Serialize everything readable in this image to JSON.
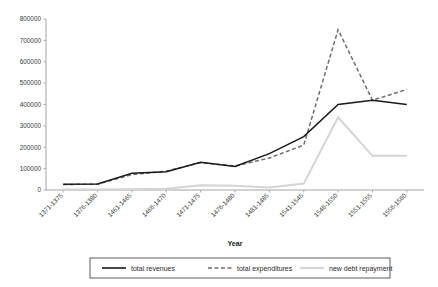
{
  "chart_data": {
    "type": "line",
    "title": "",
    "xlabel": "Year",
    "ylabel": "",
    "ylim": [
      0,
      800000
    ],
    "ytick_values": [
      0,
      100000,
      200000,
      300000,
      400000,
      500000,
      600000,
      700000,
      800000
    ],
    "ytick_labels": [
      "0",
      "100000",
      "200000",
      "300000",
      "400000",
      "500000",
      "600000",
      "700000",
      "800000"
    ],
    "grid": false,
    "legend_position": "bottom",
    "categories": [
      "1371-1375",
      "1376-1380",
      "1461-1465",
      "1466-1470",
      "1471-1475",
      "1476-1480",
      "1481-1485",
      "1541-1545",
      "1546-1550",
      "1551-1555",
      "1556-1560"
    ],
    "series": [
      {
        "name": "total revenues",
        "style": "solid",
        "color": "#1a1a1a",
        "values": [
          27000,
          28000,
          78000,
          85000,
          130000,
          110000,
          170000,
          250000,
          400000,
          420000,
          400000
        ]
      },
      {
        "name": "total expenditures",
        "style": "dashed",
        "color": "#6e6e6e",
        "values": [
          26000,
          27000,
          72000,
          88000,
          128000,
          112000,
          150000,
          210000,
          750000,
          420000,
          470000
        ]
      },
      {
        "name": "new debt repayment",
        "style": "solid",
        "color": "#d4d4d4",
        "values": [
          2000,
          2000,
          3000,
          6000,
          22000,
          20000,
          12000,
          30000,
          340000,
          160000,
          160000
        ]
      }
    ]
  },
  "legend": {
    "items": [
      {
        "label": "total revenues",
        "swatch": "solid-black-line-swatch"
      },
      {
        "label": "total expenditures",
        "swatch": "dashed-gray-line-swatch"
      },
      {
        "label": "new debt repayment",
        "swatch": "solid-lightgray-line-swatch"
      }
    ]
  },
  "axis": {
    "x_title": "Year"
  }
}
